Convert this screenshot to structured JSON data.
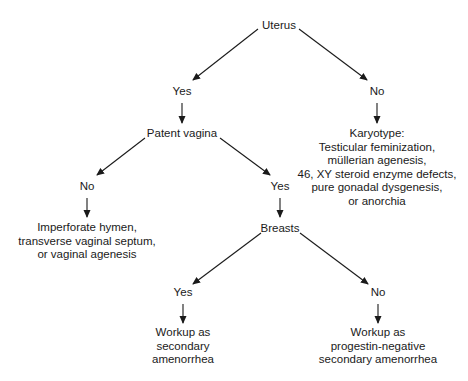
{
  "diagram": {
    "type": "decision-tree",
    "nodes": {
      "uterus": {
        "label": "Uterus"
      },
      "uterus_yes": {
        "label": "Yes"
      },
      "uterus_no": {
        "label": "No"
      },
      "patent_vagina": {
        "label": "Patent vagina"
      },
      "karyotype": {
        "lines": [
          "Karyotype:",
          "Testicular feminization,",
          "müllerian agenesis,",
          "46, XY steroid enzyme defects,",
          "pure gonadal dysgenesis,",
          "or anorchia"
        ]
      },
      "vagina_no": {
        "label": "No"
      },
      "vagina_yes": {
        "label": "Yes"
      },
      "outflow_defects": {
        "lines": [
          "Imperforate hymen,",
          "transverse vaginal septum,",
          "or vaginal agenesis"
        ]
      },
      "breasts": {
        "label": "Breasts"
      },
      "breasts_yes": {
        "label": "Yes"
      },
      "breasts_no": {
        "label": "No"
      },
      "secondary_workup": {
        "lines": [
          "Workup as",
          "secondary",
          "amenorrhea"
        ]
      },
      "progestin_negative_workup": {
        "lines": [
          "Workup as",
          "progestin-negative",
          "secondary amenorrhea"
        ]
      }
    },
    "edges": [
      {
        "from": "uterus",
        "to": "uterus_yes"
      },
      {
        "from": "uterus",
        "to": "uterus_no"
      },
      {
        "from": "uterus_yes",
        "to": "patent_vagina"
      },
      {
        "from": "uterus_no",
        "to": "karyotype"
      },
      {
        "from": "patent_vagina",
        "to": "vagina_no"
      },
      {
        "from": "patent_vagina",
        "to": "vagina_yes"
      },
      {
        "from": "vagina_no",
        "to": "outflow_defects"
      },
      {
        "from": "vagina_yes",
        "to": "breasts"
      },
      {
        "from": "breasts",
        "to": "breasts_yes"
      },
      {
        "from": "breasts",
        "to": "breasts_no"
      },
      {
        "from": "breasts_yes",
        "to": "secondary_workup"
      },
      {
        "from": "breasts_no",
        "to": "progestin_negative_workup"
      }
    ],
    "colors": {
      "background": "#ffffff",
      "ink": "#1a1a1a"
    }
  }
}
